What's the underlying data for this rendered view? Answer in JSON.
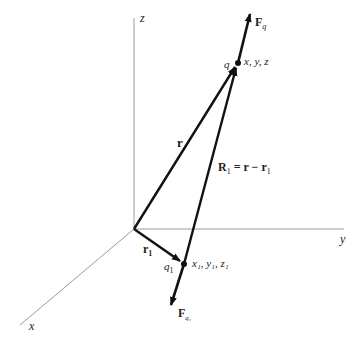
{
  "diagram": {
    "axes": {
      "z_label": "z",
      "y_label": "y",
      "x_label": "x"
    },
    "points": {
      "q": {
        "label": "q",
        "coords": "x, y, z"
      },
      "q1": {
        "label": "q",
        "sub": "1",
        "coords": "x₁, y₁, z₁"
      }
    },
    "vectors": {
      "r": {
        "label": "r"
      },
      "r1": {
        "label": "r",
        "sub": "1"
      },
      "R1": {
        "label": "R",
        "sub": "1",
        "eq": " = r − r",
        "eq_sub": "1"
      },
      "Fq": {
        "label": "F",
        "sub": "q"
      },
      "Fq1": {
        "label": "F",
        "sub": "q₁"
      }
    },
    "colors": {
      "axis": "#9a9a9a",
      "vector": "#111111"
    }
  }
}
